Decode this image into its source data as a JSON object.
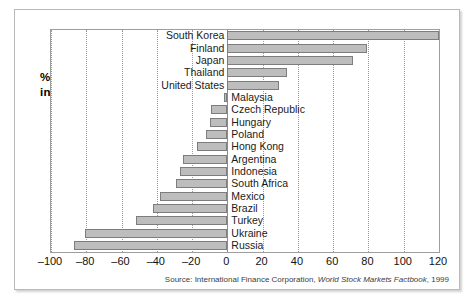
{
  "caption": {
    "line1": "% change",
    "line2": "in $ terms"
  },
  "source": {
    "prefix": "Source: International Finance Corporation, ",
    "italic": "World Stock Markets Factbook",
    "suffix": ", 1999"
  },
  "chart_data": {
    "type": "bar",
    "orientation": "horizontal",
    "title": "",
    "subtitle": "",
    "xlabel": "% change in $ terms",
    "ylabel": "",
    "xlim": [
      -100,
      120
    ],
    "grid": true,
    "legend": false,
    "ticks": [
      -100,
      -80,
      -60,
      -40,
      -20,
      0,
      20,
      40,
      60,
      80,
      100,
      120
    ],
    "tick_labels": [
      "–100",
      "–80",
      "–60",
      "–40",
      "–20",
      "0",
      "20",
      "40",
      "60",
      "80",
      "100",
      "120"
    ],
    "bar_color": "#bdbdbd",
    "bar_edge_color": "#7d7d7d",
    "categories": [
      "South Korea",
      "Finland",
      "Japan",
      "Thailand",
      "United States",
      "Malaysia",
      "Czech Republic",
      "Hungary",
      "Poland",
      "Hong Kong",
      "Argentina",
      "Indonesia",
      "South Africa",
      "Mexico",
      "Brazil",
      "Turkey",
      "Ukraine",
      "Russia"
    ],
    "values": [
      120,
      79,
      71,
      34,
      29,
      -2,
      -9,
      -10,
      -12,
      -17,
      -25,
      -27,
      -29,
      -38,
      -42,
      -52,
      -81,
      -87
    ]
  }
}
